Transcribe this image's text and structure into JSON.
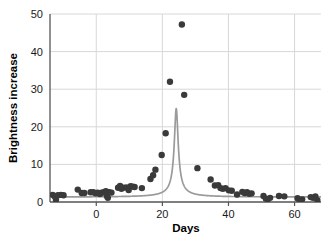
{
  "chart_data": {
    "type": "scatter",
    "title": "",
    "subtitle": "",
    "xlabel": "Days",
    "ylabel": "Brightness increase",
    "xlim": [
      -14,
      68
    ],
    "ylim": [
      0,
      50
    ],
    "xticks": [
      0,
      20,
      40,
      60
    ],
    "xtick_labels": [
      "0",
      "20",
      "40",
      "60"
    ],
    "yticks": [
      0,
      10,
      20,
      30,
      40,
      50
    ],
    "ytick_labels": [
      "0",
      "10",
      "20",
      "30",
      "40",
      "50"
    ],
    "grid": "horizontal-and-vertical",
    "legend": "none",
    "annotations": [],
    "colors": {
      "marker": "#3a3a3a",
      "curve": "#9a9a9a",
      "axis": "#555555",
      "grid": "#d8d8d8",
      "background": "#ffffff",
      "text": "#000000"
    },
    "marker_style": "filled-circle",
    "marker_size_px": 3.2,
    "curve_note": "Microlensing magnification curve peaks off-scale above 50 near day 24",
    "series": [
      {
        "name": "Observed brightness increase",
        "kind": "scatter",
        "points": [
          [
            -13.2,
            1.9
          ],
          [
            -12.6,
            1.5
          ],
          [
            -12.2,
            0.6
          ],
          [
            -11.6,
            1.8
          ],
          [
            -10.7,
            1.9
          ],
          [
            -9.9,
            1.8
          ],
          [
            -5.6,
            3.3
          ],
          [
            -4.4,
            2.4
          ],
          [
            -3.6,
            2.4
          ],
          [
            -1.7,
            2.6
          ],
          [
            -0.9,
            2.6
          ],
          [
            -0.2,
            2.3
          ],
          [
            0.4,
            2.5
          ],
          [
            1.1,
            2.1
          ],
          [
            1.6,
            2.5
          ],
          [
            2.3,
            2.6
          ],
          [
            2.9,
            2.9
          ],
          [
            3.2,
            1.6
          ],
          [
            3.5,
            1.1
          ],
          [
            3.9,
            2.6
          ],
          [
            4.6,
            2.5
          ],
          [
            6.6,
            3.8
          ],
          [
            7.2,
            4.3
          ],
          [
            7.6,
            3.5
          ],
          [
            8.2,
            3.8
          ],
          [
            9.1,
            3.9
          ],
          [
            9.8,
            3.2
          ],
          [
            10.4,
            4.2
          ],
          [
            11.0,
            4.1
          ],
          [
            11.6,
            4.0
          ],
          [
            13.8,
            3.7
          ],
          [
            16.4,
            6.1
          ],
          [
            17.2,
            7.1
          ],
          [
            17.9,
            8.6
          ],
          [
            19.8,
            12.5
          ],
          [
            21.0,
            18.3
          ],
          [
            22.3,
            32.0
          ],
          [
            25.9,
            47.2
          ],
          [
            26.6,
            28.5
          ],
          [
            30.6,
            9.0
          ],
          [
            34.6,
            6.0
          ],
          [
            35.9,
            4.4
          ],
          [
            36.9,
            4.5
          ],
          [
            37.6,
            3.7
          ],
          [
            38.3,
            3.5
          ],
          [
            39.1,
            3.7
          ],
          [
            40.1,
            3.1
          ],
          [
            41.0,
            3.0
          ],
          [
            42.6,
            2.0
          ],
          [
            44.2,
            2.7
          ],
          [
            44.9,
            2.4
          ],
          [
            45.6,
            2.6
          ],
          [
            46.3,
            2.2
          ],
          [
            47.0,
            2.3
          ],
          [
            50.6,
            1.6
          ],
          [
            51.3,
            0.9
          ],
          [
            51.9,
            0.7
          ],
          [
            52.6,
            1.1
          ],
          [
            55.3,
            1.6
          ],
          [
            56.9,
            1.5
          ],
          [
            60.9,
            1.0
          ],
          [
            61.6,
            0.4
          ],
          [
            62.3,
            0.7
          ],
          [
            64.9,
            1.3
          ],
          [
            65.6,
            1.1
          ],
          [
            66.3,
            1.5
          ],
          [
            66.9,
            0.5
          ]
        ]
      },
      {
        "name": "Best-fit microlensing model",
        "kind": "line",
        "peak_day": 24.2,
        "baseline": 1.3,
        "peak_value_offscale": true
      }
    ]
  }
}
